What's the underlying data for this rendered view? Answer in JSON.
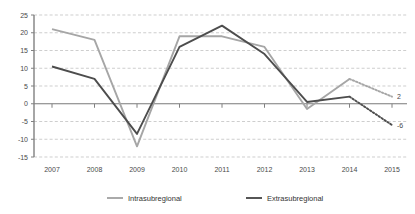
{
  "chart_data": {
    "type": "line",
    "title": "",
    "subtitle": "",
    "xlabel": "",
    "ylabel": "",
    "categories": [
      "2007",
      "2008",
      "2009",
      "2010",
      "2011",
      "2012",
      "2013",
      "2014",
      "2015"
    ],
    "ylim": [
      -15,
      25
    ],
    "ytick_step": 5,
    "yticks": [
      "25",
      "20",
      "15",
      "10",
      "5",
      "0",
      "-5",
      "-10",
      "-15"
    ],
    "ytick_values": [
      25,
      20,
      15,
      10,
      5,
      0,
      -5,
      -10,
      -15
    ],
    "grid": true,
    "grid_style": "dashed-horizontal",
    "legend_position": "bottom",
    "series": [
      {
        "name": "Intrasubregional",
        "color": "#a6a6a6",
        "values": [
          21,
          18,
          -12,
          19,
          19,
          16,
          -1.5,
          7,
          2
        ],
        "projection_from": "2014",
        "projection_style": "dotted",
        "end_label": "2"
      },
      {
        "name": "Extrasubregional",
        "color": "#4d4d4d",
        "values": [
          10.5,
          7,
          -8.5,
          16,
          22,
          14,
          0.5,
          2,
          -6
        ],
        "projection_from": "2014",
        "projection_style": "dotted",
        "end_label": "-6"
      }
    ],
    "annotations": [
      {
        "text": "2",
        "series": "Intrasubregional",
        "at": "2015"
      },
      {
        "text": "-6",
        "series": "Extrasubregional",
        "at": "2015"
      }
    ]
  },
  "legend": {
    "items": [
      {
        "label": "Intrasubregional",
        "color": "#a6a6a6"
      },
      {
        "label": "Extrasubregional",
        "color": "#4d4d4d"
      }
    ]
  }
}
